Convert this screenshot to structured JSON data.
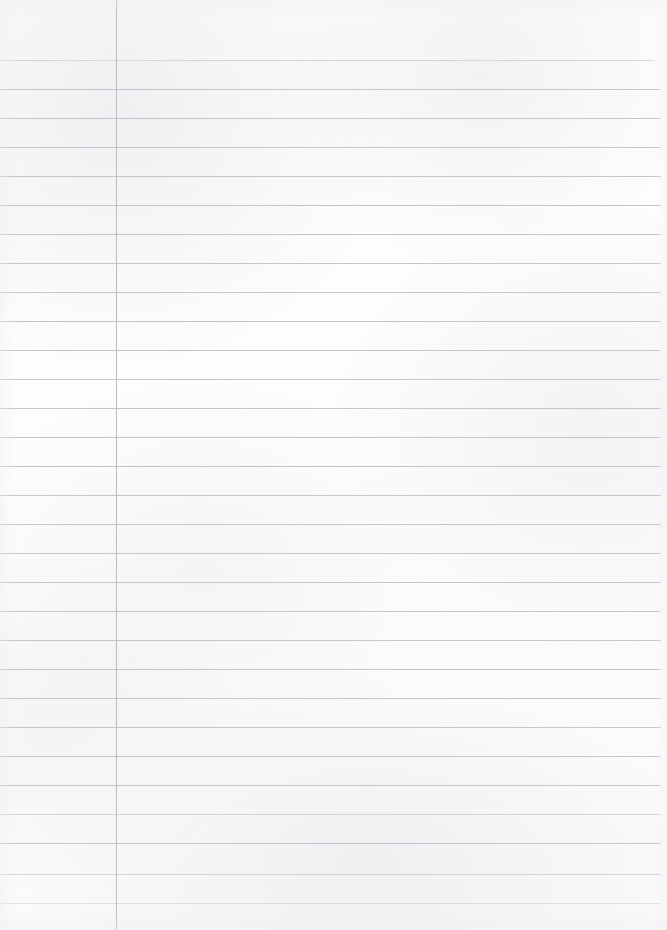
{
  "page": {
    "kind": "ruled-notebook-paper-scan",
    "content_text": "",
    "width_px": 667,
    "height_px": 930,
    "paper_color": "#fdfdfd",
    "rule_color": "#b9bcc2",
    "margin_rule_color": "#b2b5bb"
  },
  "ruling": {
    "type": "horizontal-lines",
    "count": 30,
    "first_line_y": 60,
    "spacing_px": 29,
    "line_left_x": 0,
    "line_right_x": 661,
    "line_thickness_px": 1,
    "line_y_positions": [
      60,
      89,
      118,
      147,
      176,
      205,
      234,
      263,
      292,
      321,
      350,
      379,
      408,
      437,
      466,
      495,
      524,
      553,
      582,
      611,
      640,
      669,
      698,
      727,
      756,
      785,
      814,
      843,
      874,
      903
    ],
    "line_right_ends": [
      655,
      661,
      661,
      661,
      661,
      661,
      661,
      661,
      661,
      661,
      661,
      661,
      661,
      661,
      661,
      661,
      661,
      661,
      661,
      661,
      661,
      661,
      661,
      661,
      661,
      661,
      661,
      661,
      661,
      661
    ],
    "line_opacity_class": [
      "faint",
      "",
      "",
      "",
      "",
      "",
      "",
      "",
      "",
      "",
      "",
      "",
      "",
      "",
      "",
      "",
      "",
      "",
      "",
      "",
      "",
      "",
      "",
      "",
      "",
      "",
      "faint",
      "",
      "faint",
      "fainter"
    ]
  },
  "margin_rule": {
    "type": "vertical-line",
    "x": 116,
    "top_y": 0,
    "bottom_y": 930,
    "thickness_px": 1
  }
}
